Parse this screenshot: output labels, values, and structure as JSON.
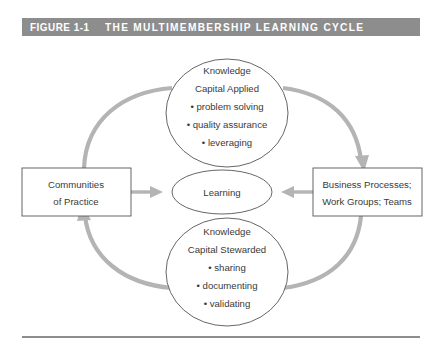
{
  "figure": {
    "label": "FIGURE 1-1",
    "title": "THE MULTIMEMBERSHIP LEARNING CYCLE",
    "titlebar_color": "#8d8d8d",
    "rule_color": "#8d8d8d"
  },
  "diagram": {
    "type": "cycle-diagram",
    "arrow_color": "#b4b4b4",
    "shape_outline_color": "#555555",
    "center": {
      "name": "Learning",
      "lines": [
        "Learning"
      ]
    },
    "left_box": {
      "lines": [
        "Communities",
        "of Practice"
      ]
    },
    "right_box": {
      "lines": [
        "Business Processes;",
        "Work Groups; Teams"
      ]
    },
    "top_ellipse": {
      "heading": [
        "Knowledge",
        "Capital Applied"
      ],
      "bullets": [
        "problem solving",
        "quality assurance",
        "leveraging"
      ]
    },
    "bottom_ellipse": {
      "heading": [
        "Knowledge",
        "Capital Stewarded"
      ],
      "bullets": [
        "sharing",
        "documenting",
        "validating"
      ]
    },
    "flow": [
      "Communities of Practice -> Knowledge Capital Applied",
      "Knowledge Capital Applied -> Business Processes; Work Groups; Teams",
      "Business Processes; Work Groups; Teams -> Knowledge Capital Stewarded",
      "Knowledge Capital Stewarded -> Communities of Practice",
      "Communities of Practice -> Learning",
      "Business Processes; Work Groups; Teams -> Learning"
    ]
  }
}
